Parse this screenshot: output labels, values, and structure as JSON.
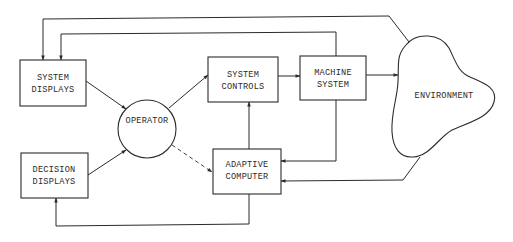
{
  "diagram": {
    "type": "block-diagram",
    "nodes": [
      {
        "id": "system_displays",
        "shape": "rect",
        "lines": [
          "SYSTEM",
          "DISPLAYS"
        ]
      },
      {
        "id": "decision_displays",
        "shape": "rect",
        "lines": [
          "DECISION",
          "DISPLAYS"
        ]
      },
      {
        "id": "operator",
        "shape": "circle",
        "lines": [
          "OPERATOR"
        ]
      },
      {
        "id": "system_controls",
        "shape": "rect",
        "lines": [
          "SYSTEM",
          "CONTROLS"
        ]
      },
      {
        "id": "machine_system",
        "shape": "rect",
        "lines": [
          "MACHINE",
          "SYSTEM"
        ]
      },
      {
        "id": "adaptive_computer",
        "shape": "rect",
        "lines": [
          "ADAPTIVE",
          "COMPUTER"
        ]
      },
      {
        "id": "environment",
        "shape": "blob",
        "lines": [
          "ENVIRONMENT"
        ]
      }
    ],
    "edges": [
      {
        "from": "system_displays",
        "to": "operator",
        "style": "solid"
      },
      {
        "from": "decision_displays",
        "to": "operator",
        "style": "solid"
      },
      {
        "from": "operator",
        "to": "system_controls",
        "style": "solid"
      },
      {
        "from": "operator",
        "to": "adaptive_computer",
        "style": "dashed"
      },
      {
        "from": "system_controls",
        "to": "machine_system",
        "style": "solid"
      },
      {
        "from": "machine_system",
        "to": "environment",
        "style": "solid"
      },
      {
        "from": "adaptive_computer",
        "to": "system_controls",
        "style": "solid"
      },
      {
        "from": "machine_system",
        "to": "adaptive_computer",
        "style": "solid"
      },
      {
        "from": "environment",
        "to": "adaptive_computer",
        "style": "solid"
      },
      {
        "from": "environment",
        "to": "system_displays",
        "style": "solid"
      },
      {
        "from": "machine_system",
        "to": "system_displays",
        "style": "solid"
      },
      {
        "from": "adaptive_computer",
        "to": "decision_displays",
        "style": "solid"
      }
    ]
  },
  "labels": {
    "system_displays": {
      "l1": "SYSTEM",
      "l2": "DISPLAYS"
    },
    "decision_displays": {
      "l1": "DECISION",
      "l2": "DISPLAYS"
    },
    "operator": {
      "l1": "OPERATOR"
    },
    "system_controls": {
      "l1": "SYSTEM",
      "l2": "CONTROLS"
    },
    "machine_system": {
      "l1": "MACHINE",
      "l2": "SYSTEM"
    },
    "adaptive_computer": {
      "l1": "ADAPTIVE",
      "l2": "COMPUTER"
    },
    "environment": {
      "l1": "ENVIRONMENT"
    }
  },
  "colors": {
    "ink": "#2b2b2b",
    "background": "#ffffff"
  }
}
